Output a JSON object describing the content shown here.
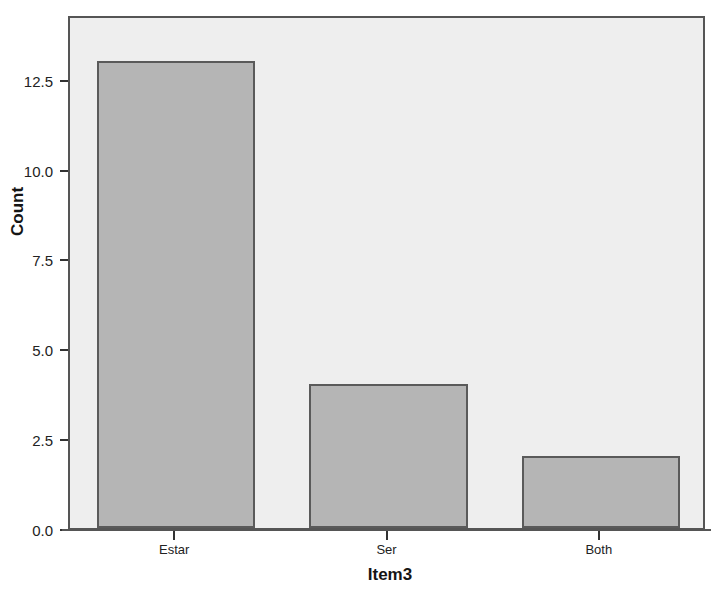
{
  "chart_data": {
    "type": "bar",
    "title": "",
    "subtitle": "",
    "categories": [
      "Estar",
      "Ser",
      "Both"
    ],
    "values": [
      13,
      4,
      2
    ],
    "xlabel": "Item3",
    "ylabel": "Count",
    "ylim": [
      0,
      14.3
    ],
    "yticks": [
      0.0,
      2.5,
      5.0,
      7.5,
      10.0,
      12.5
    ],
    "ytick_labels": [
      "0.0",
      "2.5",
      "5.0",
      "7.5",
      "10.0",
      "12.5"
    ],
    "grid": false,
    "legend": null,
    "legend_position": "none",
    "bar_fill_color": "#b5b5b5",
    "bar_border_color": "#5a5a5a",
    "plot_background_color": "#eeeeee",
    "figure_background_color": "#ffffff",
    "axis_color": "#555555"
  }
}
